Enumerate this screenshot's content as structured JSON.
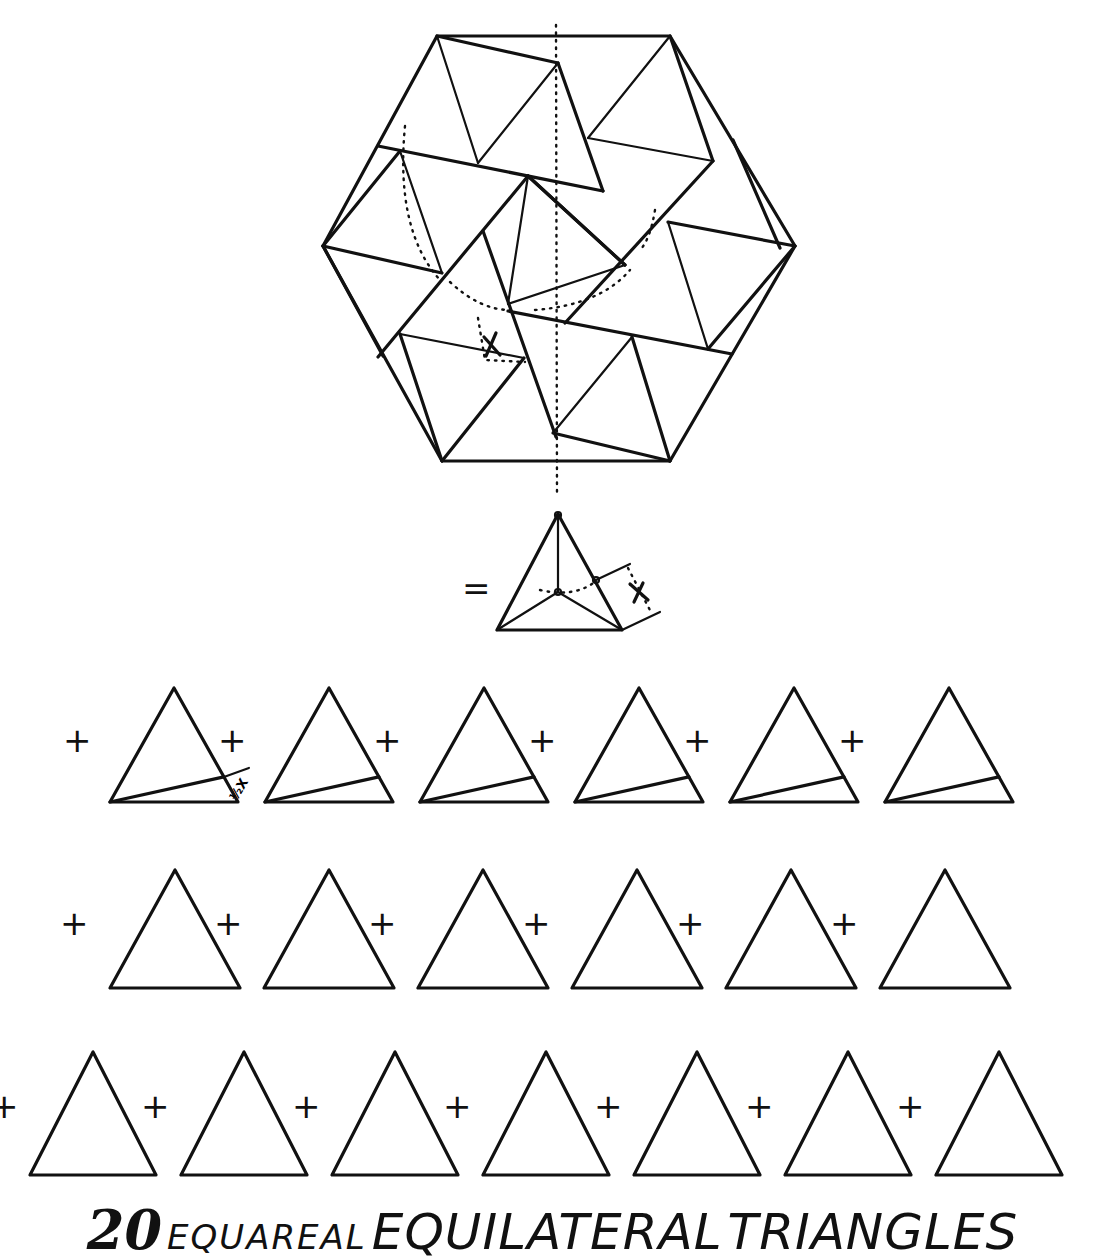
{
  "diagram": {
    "type": "geometric-dissection",
    "total_triangles": 20,
    "equals_symbol": "=",
    "plus_symbol": "+",
    "marker_label": "X",
    "half_marker_label": "½X",
    "rows": [
      {
        "name": "cut-triangles",
        "count": 6,
        "has_cut_line": true
      },
      {
        "name": "plain-triangles-row-2",
        "count": 6,
        "has_cut_line": false
      },
      {
        "name": "plain-triangles-row-3",
        "count": 7,
        "has_cut_line": false
      }
    ]
  },
  "title": {
    "number": "20",
    "word1": "EQUAREAL",
    "word2": "EQUILATERAL",
    "word3": "TRIANGLES"
  },
  "colors": {
    "ink": "#111111",
    "paper": "#ffffff"
  }
}
